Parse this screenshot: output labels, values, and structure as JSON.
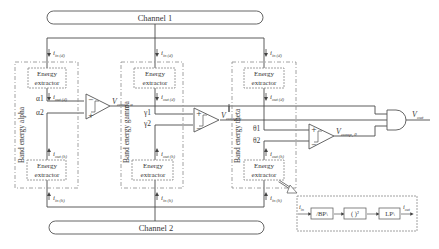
{
  "channels": {
    "top": "Channel 1",
    "bottom": "Channel 2"
  },
  "bands": [
    {
      "name": "Band energy alpha",
      "extractor_top": [
        "Energy",
        "extractor"
      ],
      "extractor_bottom": [
        "Energy",
        "extractor"
      ],
      "thresholds": [
        "α1",
        "α2"
      ],
      "comparator_output": "V",
      "comparator_output_sub": "comp, α"
    },
    {
      "name": "Band energy gamma",
      "extractor_top": [
        "Energy",
        "extractor"
      ],
      "extractor_bottom": [
        "Energy",
        "extractor"
      ],
      "thresholds": [
        "γ1",
        "γ2"
      ],
      "comparator_output": "V",
      "comparator_output_sub": "comp, γ"
    },
    {
      "name": "Band energy theta",
      "extractor_top": [
        "Energy",
        "extractor"
      ],
      "extractor_bottom": [
        "Energy",
        "extractor"
      ],
      "thresholds": [
        "θ1",
        "θ2"
      ],
      "comparator_output": "V",
      "comparator_output_sub": "comp, θ"
    }
  ],
  "currents": {
    "in_d": "i",
    "in_d_sub": "in (d)",
    "out_d": "i",
    "out_d_sub": "out (d)",
    "out_h": "i",
    "out_h_sub": "out (h)",
    "in_h": "i",
    "in_h_sub": "in (h)"
  },
  "output": {
    "label": "V",
    "sub": "out",
    "gate": "AND"
  },
  "inset": {
    "input": "i",
    "input_sub": "in",
    "blocks": [
      "/BP\\",
      "( )²",
      "LP\\"
    ],
    "output": "i",
    "output_sub": "out"
  },
  "colors": {
    "line": "#4a4a4a",
    "dash": "#8a8a8a",
    "box": "#6a6a6a"
  }
}
